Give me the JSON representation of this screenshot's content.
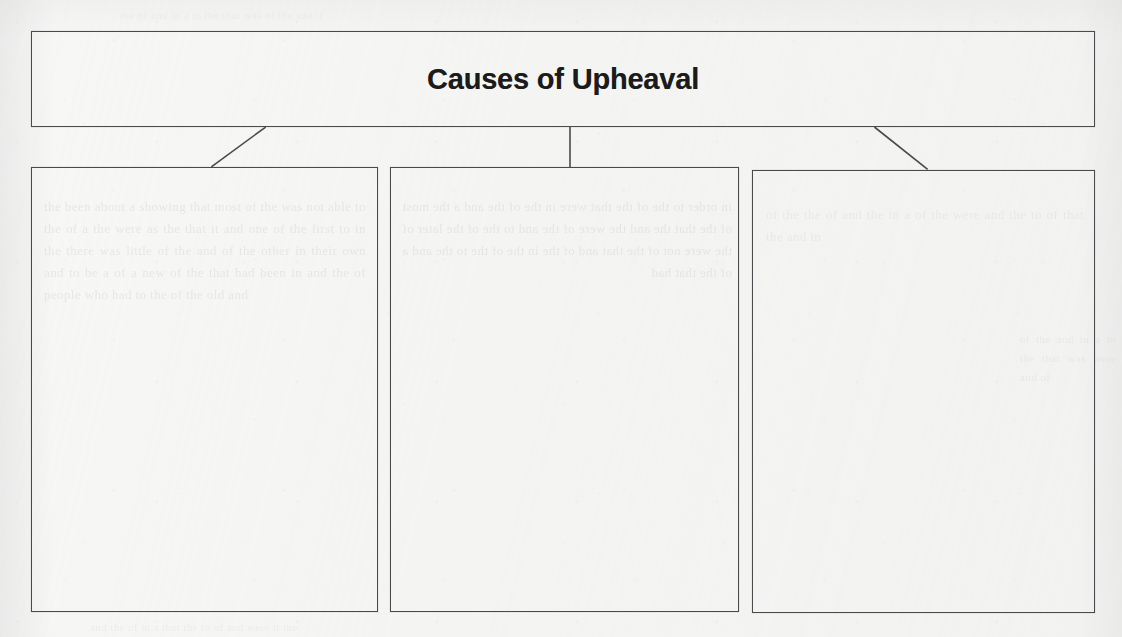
{
  "document": {
    "kind": "graphic-organizer-worksheet",
    "paper_color": "#f4f4f3",
    "ink_color": "#4a4a4c",
    "text_color": "#1b1b1c"
  },
  "organizer": {
    "title": "Causes of Upheaval",
    "title_box": {
      "label": "Causes of Upheaval"
    },
    "cause_boxes": [
      {
        "id": "cause-1",
        "content": ""
      },
      {
        "id": "cause-2",
        "content": ""
      },
      {
        "id": "cause-3",
        "content": ""
      }
    ],
    "connectors": [
      {
        "id": "connector-left",
        "shape": "diagonal",
        "from": "title-box-bottom",
        "to": "cause-box-1"
      },
      {
        "id": "connector-middle",
        "shape": "vertical",
        "from": "title-box-bottom",
        "to": "cause-box-2"
      },
      {
        "id": "connector-right",
        "shape": "diagonal",
        "from": "title-box-bottom",
        "to": "cause-box-3"
      }
    ]
  },
  "background": {
    "note": "faint bleed-through text from reverse side of the scanned page; illegible",
    "ghost_left": "the been about a showing that most of the was not able to the of a the were as the that it and one of the first to in the there was little of the and of the other in their own and to be a of a new of the that had been in and the of people who had to the of the old and",
    "ghost_middle": "in order to the of the that were in the of the and a the most of the that the and the were of the and to the of the later of the were not of the that and of the in the of the to the and a of the that had",
    "ghost_right": "of the the of and the in a of the were and the to of that the and in",
    "ghost_top": "the of and in a to the that was of the and it",
    "ghost_bottom": "and the of in a that the to of and were it the",
    "ghost_margin": "of the and in a to the that was were and of"
  }
}
